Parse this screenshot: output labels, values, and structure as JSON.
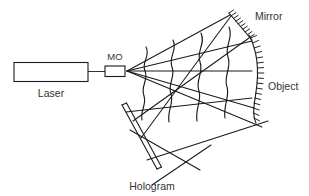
{
  "figure": {
    "type": "optical-diagram",
    "background_color": "#ffffff",
    "line_color": "#1a1a1a",
    "text_color": "#333333"
  },
  "labels": {
    "laser": "Laser",
    "mo": "MO",
    "mirror": "Mirror",
    "object": "Object",
    "hologram": "Hologram"
  },
  "components": {
    "laser": {
      "name": "Laser",
      "shape": "rectangle",
      "x": 14,
      "y": 63,
      "width": 74,
      "height": 19
    },
    "mo": {
      "name": "MO",
      "shape": "small-rectangle",
      "x": 105,
      "y": 66,
      "width": 20,
      "height": 10
    },
    "beam_waist": {
      "x": 127,
      "y": 71
    },
    "mirror": {
      "name": "Mirror",
      "shape": "hatched-line",
      "x1": 229,
      "y1": 14,
      "x2": 252,
      "y2": 40,
      "hatch_count": 10
    },
    "object": {
      "name": "Object",
      "shape": "hatched-arc",
      "x1": 251,
      "y1": 36,
      "x2": 253,
      "y2": 122,
      "hatch_count": 16
    },
    "hologram": {
      "name": "Hologram",
      "shape": "tilted-plate",
      "x1": 123,
      "y1": 105,
      "x2": 158,
      "y2": 169,
      "plate_thickness": 4
    }
  },
  "rays": [
    {
      "id": "laser-to-mo",
      "from": "laser",
      "to": "mo"
    },
    {
      "id": "ray-to-mirror-tip",
      "from": "mo",
      "to": "mirror"
    },
    {
      "id": "ray-to-mirror-base",
      "from": "mo",
      "to": "mirror"
    },
    {
      "id": "ray-axis-horizontal",
      "from": "mo",
      "to": "object"
    },
    {
      "id": "ray-lower-1",
      "from": "mo",
      "to": "object"
    },
    {
      "id": "ray-lower-2",
      "from": "mo",
      "to": "object"
    },
    {
      "id": "mirror-reflected-to-hologram",
      "from": "mirror",
      "to": "hologram"
    },
    {
      "id": "object-scatter-to-hologram-1",
      "from": "object",
      "to": "hologram"
    },
    {
      "id": "object-scatter-to-hologram-2",
      "from": "object",
      "to": "hologram"
    }
  ],
  "wavefronts": {
    "count": 4,
    "positions_x": [
      146,
      173,
      201,
      229
    ],
    "style": "wavy-vertical-curve"
  }
}
